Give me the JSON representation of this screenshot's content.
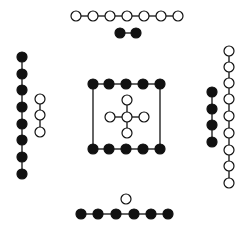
{
  "diagram": {
    "width": 247,
    "height": 233,
    "background": "#ffffff",
    "stroke_color": "#111111",
    "fill_dark": "#111111",
    "fill_open": "#ffffff",
    "node_radius": 5,
    "groups": [
      {
        "name": "top-open-chain",
        "filled": false,
        "connected": true,
        "nodes": [
          [
            76,
            16
          ],
          [
            93,
            16
          ],
          [
            110,
            16
          ],
          [
            127,
            16
          ],
          [
            144,
            16
          ],
          [
            161,
            16
          ],
          [
            178,
            16
          ]
        ]
      },
      {
        "name": "top-filled-pair",
        "filled": true,
        "connected": true,
        "nodes": [
          [
            120,
            33
          ],
          [
            136,
            33
          ]
        ]
      },
      {
        "name": "left-filled-chain",
        "filled": true,
        "connected": true,
        "nodes": [
          [
            22,
            57
          ],
          [
            22,
            74
          ],
          [
            22,
            90
          ],
          [
            22,
            107
          ],
          [
            22,
            124
          ],
          [
            22,
            140
          ],
          [
            22,
            157
          ],
          [
            22,
            174
          ]
        ]
      },
      {
        "name": "left-open-chain",
        "filled": false,
        "connected": true,
        "nodes": [
          [
            40,
            99
          ],
          [
            40,
            115
          ],
          [
            40,
            132
          ]
        ]
      },
      {
        "name": "center-top-filled-row",
        "filled": true,
        "connected": true,
        "nodes": [
          [
            93,
            84
          ],
          [
            109,
            84
          ],
          [
            126,
            84
          ],
          [
            143,
            84
          ],
          [
            160,
            84
          ]
        ]
      },
      {
        "name": "center-bottom-filled-row",
        "filled": true,
        "connected": true,
        "nodes": [
          [
            93,
            149
          ],
          [
            109,
            149
          ],
          [
            126,
            149
          ],
          [
            143,
            149
          ],
          [
            160,
            149
          ]
        ]
      },
      {
        "name": "right-filled-chain",
        "filled": true,
        "connected": true,
        "nodes": [
          [
            212,
            92
          ],
          [
            212,
            109
          ],
          [
            212,
            125
          ],
          [
            212,
            142
          ]
        ]
      },
      {
        "name": "right-open-chain",
        "filled": false,
        "connected": true,
        "nodes": [
          [
            229,
            51
          ],
          [
            229,
            67
          ],
          [
            229,
            83
          ],
          [
            229,
            99
          ],
          [
            229,
            116
          ],
          [
            229,
            133
          ],
          [
            229,
            150
          ],
          [
            229,
            166
          ],
          [
            229,
            183
          ]
        ]
      },
      {
        "name": "bottom-single-open",
        "filled": false,
        "connected": false,
        "nodes": [
          [
            126,
            199
          ]
        ]
      },
      {
        "name": "bottom-filled-chain",
        "filled": true,
        "connected": true,
        "nodes": [
          [
            81,
            214
          ],
          [
            98,
            214
          ],
          [
            116,
            214
          ],
          [
            134,
            214
          ],
          [
            151,
            214
          ],
          [
            168,
            214
          ]
        ]
      }
    ],
    "center_box_sides": [
      [
        [
          93,
          84
        ],
        [
          93,
          149
        ]
      ],
      [
        [
          160,
          84
        ],
        [
          160,
          149
        ]
      ]
    ],
    "center_cross": {
      "center": [
        127,
        117
      ],
      "arms": [
        [
          127,
          100
        ],
        [
          127,
          133
        ],
        [
          110,
          117
        ],
        [
          144,
          117
        ]
      ],
      "filled": false
    }
  }
}
